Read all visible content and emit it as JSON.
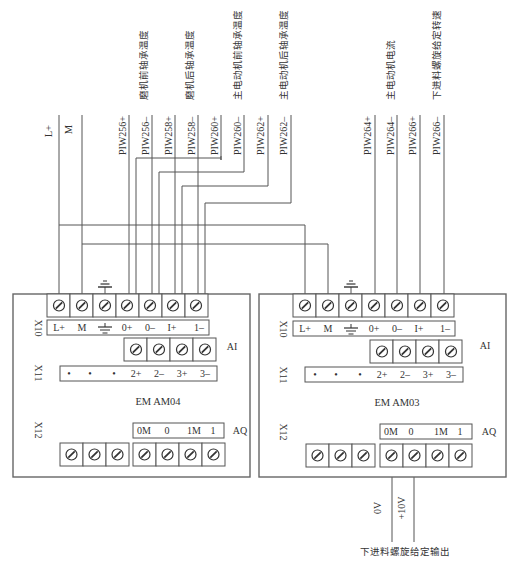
{
  "signals_left": [
    {
      "id": "L+",
      "label": "L+"
    },
    {
      "id": "M",
      "label": "M"
    },
    {
      "id": "PIW256+",
      "label": "PIW256+"
    },
    {
      "id": "PIW256-",
      "label": "PIW256–"
    },
    {
      "id": "PIW258+",
      "label": "PIW258+"
    },
    {
      "id": "PIW258-",
      "label": "PIW258–"
    },
    {
      "id": "PIW260+",
      "label": "PIW260+"
    },
    {
      "id": "PIW260-",
      "label": "PIW260–"
    },
    {
      "id": "PIW262+",
      "label": "PIW262+"
    },
    {
      "id": "PIW262-",
      "label": "PIW262–"
    }
  ],
  "signals_right": [
    {
      "id": "PIW264+",
      "label": "PIW264+"
    },
    {
      "id": "PIW264-",
      "label": "PIW264–"
    },
    {
      "id": "PIW266+",
      "label": "PIW266+"
    },
    {
      "id": "PIW266-",
      "label": "PIW266–"
    }
  ],
  "descriptions": {
    "grinder_front_bearing_temp": "磨机前轴承温度",
    "grinder_rear_bearing_temp": "磨机后轴承温度",
    "main_motor_front_bearing_temp": "主电动机前轴承温度",
    "main_motor_rear_bearing_temp": "主电动机后轴承温度",
    "main_motor_current": "主电动机电流",
    "lower_feed_screw_speed": "下进料螺旋给定转速"
  },
  "modules": [
    {
      "name": "EM AM04",
      "x10_label": "X10",
      "x11_label": "X11",
      "x12_label": "X12",
      "ai_label": "AI",
      "aq_label": "AQ",
      "x10_terminals": [
        "L+",
        "M",
        "⏚",
        "0+",
        "0–",
        "I+",
        "1–"
      ],
      "x11_terminals": [
        "•",
        "•",
        "•",
        "2+",
        "2–",
        "3+",
        "3–"
      ],
      "x12_terminals": [
        "0M",
        "0",
        "1M",
        "1"
      ]
    },
    {
      "name": "EM AM03",
      "x10_label": "X10",
      "x11_label": "X11",
      "x12_label": "X12",
      "ai_label": "AI",
      "aq_label": "AQ",
      "x10_terminals": [
        "L+",
        "M",
        "⏚",
        "0+",
        "0–",
        "I+",
        "1–"
      ],
      "x11_terminals": [
        "•",
        "•",
        "•",
        "2+",
        "2–",
        "3+",
        "3–"
      ],
      "x12_terminals": [
        "0M",
        "0",
        "1M",
        "1"
      ]
    }
  ],
  "output": {
    "v0_label": "0V",
    "v10_label": "+10V",
    "caption": "下进料螺旋给定输出"
  },
  "colors": {
    "line": "#555555",
    "text": "#333333",
    "background": "#ffffff"
  }
}
